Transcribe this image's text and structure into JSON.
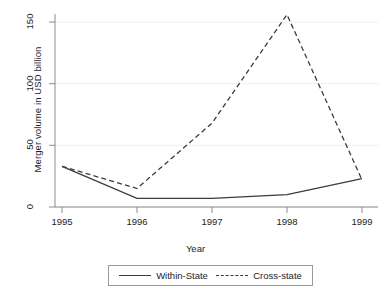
{
  "chart_data": {
    "type": "line",
    "title": "",
    "xlabel": "Year",
    "ylabel": "Merger volume in USD billion",
    "x": [
      1995,
      1996,
      1997,
      1998,
      1999
    ],
    "categories": [
      "1995",
      "1996",
      "1997",
      "1998",
      "1999"
    ],
    "xlim": [
      1995,
      1999
    ],
    "ylim": [
      0,
      158
    ],
    "yticks": [
      0,
      50,
      100,
      150
    ],
    "ytick_labels": [
      "0",
      "50",
      "100",
      "150"
    ],
    "xticks": [
      1995,
      1996,
      1997,
      1998,
      1999
    ],
    "xtick_labels": [
      "1995",
      "1996",
      "1997",
      "1998",
      "1999"
    ],
    "grid": "horizontal",
    "legend_position": "below-plot",
    "series": [
      {
        "name": "Within-State",
        "style": "solid",
        "color": "#3c3c3c",
        "values": [
          33,
          7,
          7,
          10,
          23
        ]
      },
      {
        "name": "Cross-state",
        "style": "dashed",
        "color": "#3c3c3c",
        "values": [
          33,
          15,
          68,
          156,
          22
        ]
      }
    ]
  },
  "axes": {
    "ylabel": "Merger volume in USD billion",
    "xlabel": "Year",
    "ytick_0": "0",
    "ytick_1": "50",
    "ytick_2": "100",
    "ytick_3": "150",
    "xtick_0": "1995",
    "xtick_1": "1996",
    "xtick_2": "1997",
    "xtick_3": "1998",
    "xtick_4": "1999"
  },
  "legend": {
    "items": [
      {
        "label": "Within-State",
        "style": "solid"
      },
      {
        "label": "Cross-state",
        "style": "dashed"
      }
    ]
  },
  "colors": {
    "line": "#3c3c3c",
    "axis": "#8c8c8c",
    "grid": "#eeeeee",
    "text": "#1d1d1d",
    "background": "#ffffff"
  }
}
